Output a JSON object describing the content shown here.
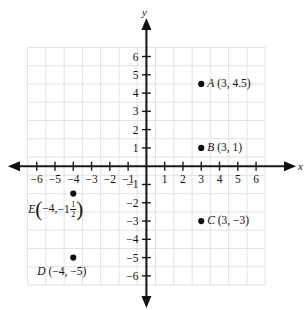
{
  "figure": {
    "type": "coordinate-plane",
    "axes": {
      "x_label": "x",
      "y_label": "y",
      "x_ticks": [
        "-6",
        "-5",
        "-4",
        "-3",
        "-2",
        "-1",
        "1",
        "2",
        "3",
        "4",
        "5",
        "6"
      ],
      "y_ticks": [
        "6",
        "5",
        "4",
        "3",
        "2",
        "1",
        "-1",
        "-2",
        "-3",
        "-4",
        "-5",
        "-6"
      ],
      "xlim": [
        -6.5,
        6.5
      ],
      "ylim": [
        -6.5,
        6.5
      ],
      "grid": true
    },
    "points": [
      {
        "name": "A",
        "label_coords": "(3, 4.5)",
        "x": 3,
        "y": 4.5,
        "label_position": "right"
      },
      {
        "name": "B",
        "label_coords": "(3, 1)",
        "x": 3,
        "y": 1,
        "label_position": "right"
      },
      {
        "name": "C",
        "label_coords": "(3, −3)",
        "x": 3,
        "y": -3,
        "label_position": "right"
      },
      {
        "name": "D",
        "label_coords": "(−4, −5)",
        "x": -4,
        "y": -5,
        "label_position": "below-left"
      },
      {
        "name": "E",
        "x": -4,
        "y": -1.5,
        "label_position": "left",
        "label_parts": {
          "open_paren": "(",
          "first": "−4,",
          "whole": "−1",
          "numerator": "1",
          "denominator": "2",
          "close_paren": ")"
        }
      }
    ],
    "colors": {
      "axis": "#1a1a1a",
      "grid": "#e2e2e2",
      "point": "#111111",
      "background": "#ffffff"
    }
  },
  "chart_data": {
    "type": "scatter",
    "title": "",
    "xlabel": "x",
    "ylabel": "y",
    "xlim": [
      -6.5,
      6.5
    ],
    "ylim": [
      -6.5,
      6.5
    ],
    "grid": true,
    "legend": "none",
    "point_labels": [
      "A (3, 4.5)",
      "B (3, 1)",
      "C (3, −3)",
      "D (−4, −5)",
      "E (−4, −1 1/2)"
    ],
    "x": [
      3,
      3,
      3,
      -4,
      -4
    ],
    "y": [
      4.5,
      1,
      -3,
      -5,
      -1.5
    ]
  }
}
